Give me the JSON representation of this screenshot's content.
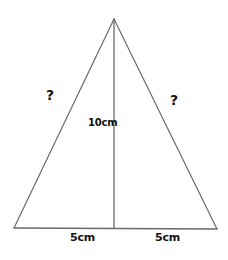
{
  "figure": {
    "type": "isosceles-triangle-with-median",
    "background_color": "#ffffff",
    "line_color": "#6a6a6a",
    "text_color": "#111111",
    "vertices": {
      "apex": [
        114,
        19
      ],
      "bottom_left": [
        14,
        228
      ],
      "bottom_right": [
        217,
        229
      ],
      "base_midpoint": [
        114,
        228
      ]
    },
    "labels": {
      "left_side": "?",
      "right_side": "?",
      "height": "10cm",
      "base_left": "5cm",
      "base_right": "5cm"
    }
  }
}
